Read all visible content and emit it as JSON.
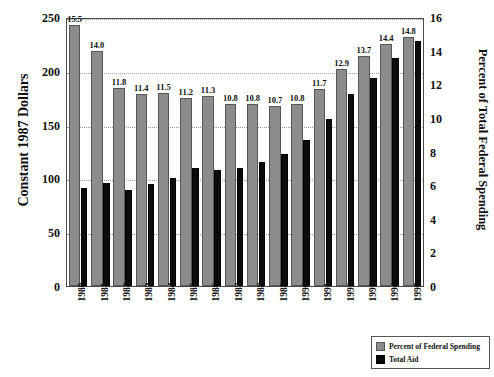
{
  "chart_data": {
    "type": "bar",
    "title": "",
    "xlabel": "",
    "ylabel": "Constant 1987 Dollars",
    "y2label": "Percent of Total Federal Spending",
    "ylim": [
      0,
      250
    ],
    "y2lim": [
      0,
      16
    ],
    "yticks": [
      "0",
      "50",
      "100",
      "150",
      "200",
      "250"
    ],
    "y2ticks": [
      "0",
      "2",
      "4",
      "6",
      "8",
      "10",
      "12",
      "14",
      "16"
    ],
    "grid": true,
    "legend_position": "bottom-right",
    "categories": [
      "1980",
      "1981",
      "1982",
      "1983",
      "1984",
      "1985",
      "1986",
      "1987",
      "1988",
      "1989",
      "1990",
      "1991",
      "1992",
      "1993",
      "1994",
      "1995"
    ],
    "series": [
      {
        "name": "Percent of Federal Spending",
        "axis": "right",
        "color": "#8c8c8c",
        "labels_shown": true,
        "values": [
          15.5,
          14.0,
          11.8,
          11.4,
          11.5,
          11.2,
          11.3,
          10.8,
          10.8,
          10.7,
          10.8,
          11.7,
          12.9,
          13.7,
          14.4,
          14.8
        ]
      },
      {
        "name": "Total Aid",
        "axis": "left",
        "color": "#0b0b0b",
        "labels_shown": false,
        "values": [
          91,
          96,
          89,
          95,
          100,
          110,
          108,
          110,
          115,
          123,
          136,
          155,
          178,
          193,
          212,
          228
        ]
      }
    ]
  },
  "legend": {
    "items": [
      {
        "label": "Percent of Federal Spending",
        "swatch": "gray"
      },
      {
        "label": "Total Aid",
        "swatch": "black"
      }
    ]
  }
}
